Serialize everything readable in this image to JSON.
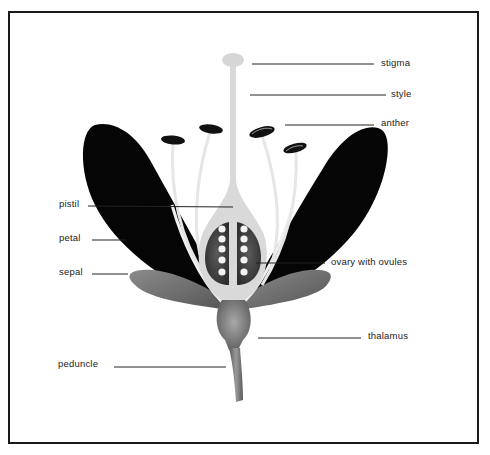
{
  "diagram": {
    "colors": {
      "frame": "#1a1a1a",
      "petal": "#050505",
      "sepal": "#6e6e6e",
      "pistil": "#d9d9d9",
      "ovary": "#4a4a4a",
      "ovule": "#f2f2f2",
      "anther": "#111111",
      "filament": "#e6e6e6",
      "stem": "#777777",
      "leader_line": "#222222"
    },
    "labels": {
      "stigma": "stigma",
      "style": "style",
      "anther": "anther",
      "pistil": "pistil",
      "petal": "petal",
      "sepal": "sepal",
      "ovary": "ovary with ovules",
      "thalamus": "thalamus",
      "peduncle": "peduncle"
    }
  }
}
